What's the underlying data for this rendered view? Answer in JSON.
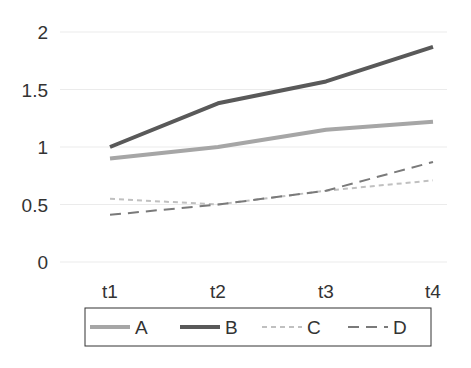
{
  "chart_data": {
    "type": "line",
    "title": "",
    "xlabel": "",
    "ylabel": "",
    "categories": [
      "t1",
      "t2",
      "t3",
      "t4"
    ],
    "ylim": [
      0,
      2
    ],
    "yticks": [
      "0",
      "0.5",
      "1",
      "1.5",
      "2"
    ],
    "grid": true,
    "legend_position": "bottom",
    "series": [
      {
        "name": "A",
        "values": [
          0.9,
          1.0,
          1.15,
          1.22
        ],
        "color": "#a6a6a6",
        "style": "solid",
        "width": 4
      },
      {
        "name": "B",
        "values": [
          1.0,
          1.38,
          1.57,
          1.87
        ],
        "color": "#595959",
        "style": "solid",
        "width": 4
      },
      {
        "name": "C",
        "values": [
          0.55,
          0.5,
          0.62,
          0.71
        ],
        "color": "#c0c0c0",
        "style": "short-dash",
        "width": 2
      },
      {
        "name": "D",
        "values": [
          0.41,
          0.5,
          0.62,
          0.87
        ],
        "color": "#7a7a7a",
        "style": "long-dash",
        "width": 2
      }
    ]
  }
}
